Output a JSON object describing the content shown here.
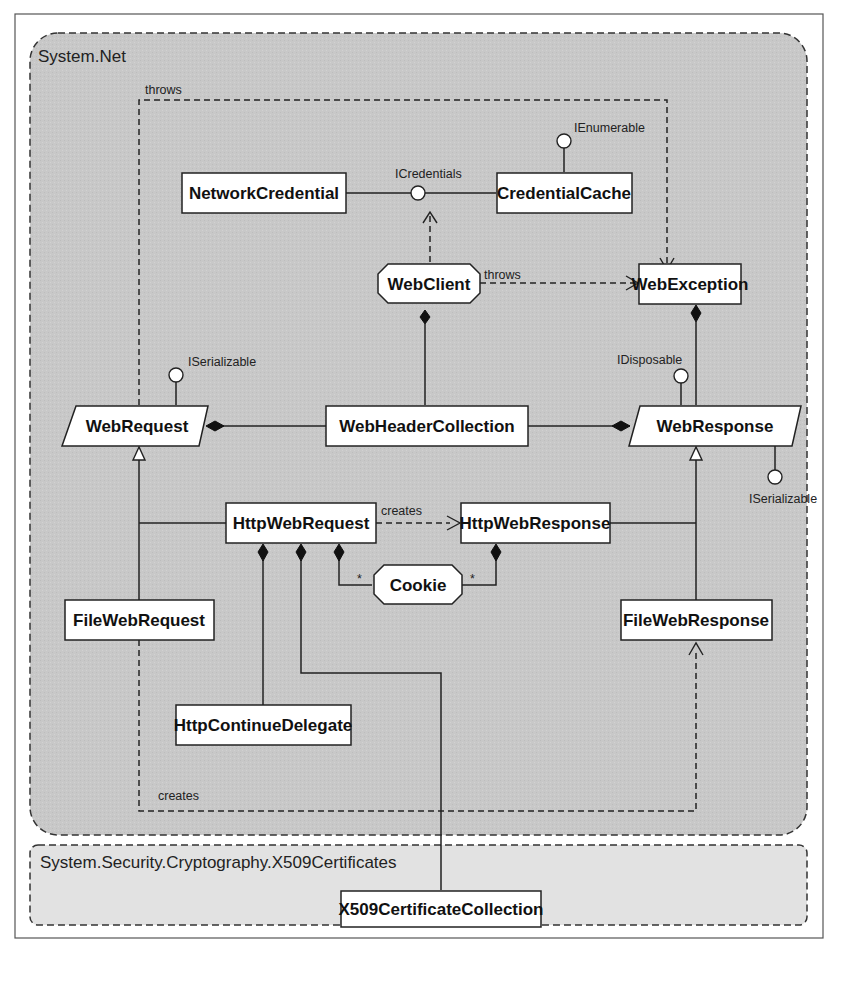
{
  "packages": {
    "system_net": "System.Net",
    "x509": "System.Security.Cryptography.X509Certificates"
  },
  "classes": {
    "network_credential": "NetworkCredential",
    "credential_cache": "CredentialCache",
    "web_client": "WebClient",
    "web_exception": "WebException",
    "web_request": "WebRequest",
    "web_header_collection": "WebHeaderCollection",
    "web_response": "WebResponse",
    "http_web_request": "HttpWebRequest",
    "http_web_response": "HttpWebResponse",
    "cookie": "Cookie",
    "file_web_request": "FileWebRequest",
    "file_web_response": "FileWebResponse",
    "http_continue_delegate": "HttpContinueDelegate",
    "x509_certificate_collection": "X509CertificateCollection"
  },
  "interfaces": {
    "icredentials": "ICredentials",
    "ienumerable": "IEnumerable",
    "iserializable_request": "ISerializable",
    "idisposable": "IDisposable",
    "iserializable_response": "ISerializable"
  },
  "labels": {
    "throws_top": "throws",
    "throws_webclient": "throws",
    "creates_http": "creates",
    "creates_file": "creates",
    "mult_cookie_req": "*",
    "mult_cookie_resp": "*"
  },
  "colors": {
    "net_bg": "#c9c9c9",
    "x509_bg": "#e4e4e4",
    "box_fill": "#ffffff",
    "line": "#222222"
  }
}
